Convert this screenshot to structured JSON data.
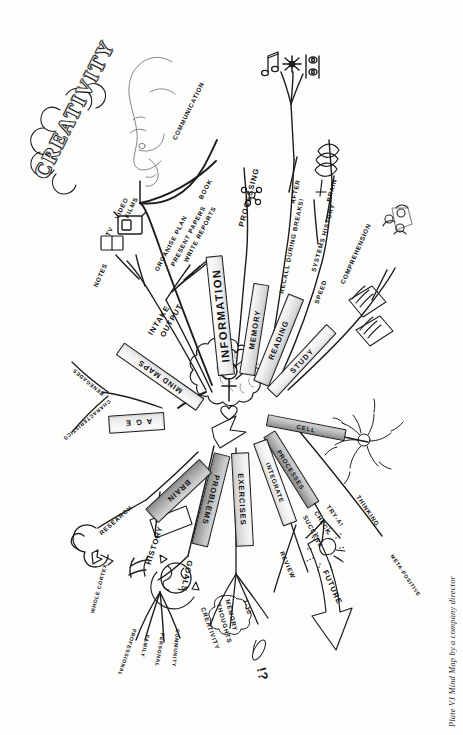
{
  "plate": {
    "caption_prefix": "Plate VJ",
    "caption_rest": " Mind Map by a company director",
    "caption_full": "Plate VJ Mind Map by a company director"
  },
  "center": {
    "label": "brain-centre",
    "icon": "brain-with-key-and-hearts"
  },
  "branches": [
    {
      "id": "creativity",
      "label": "CREATIVITY",
      "style": "ornate-script",
      "children": [
        {
          "label": "COMMUNICATION",
          "children": []
        }
      ],
      "icons": [
        "speaking-head-icon"
      ]
    },
    {
      "id": "mind-maps",
      "label": "MIND MAPS",
      "children": [
        {
          "label": "INTAKE",
          "children": [
            {
              "label": "NOTES"
            },
            {
              "label": "TV"
            },
            {
              "label": "VIDEO"
            },
            {
              "label": "FILMS"
            }
          ],
          "icons": [
            "notes-icon",
            "television-icon"
          ]
        },
        {
          "label": "OUTPUT",
          "children": [
            {
              "label": "ORGANISE PLAN"
            },
            {
              "label": "PRESENT PAPERS"
            },
            {
              "label": "WRITE REPORTS"
            },
            {
              "label": "BOOK"
            }
          ]
        }
      ]
    },
    {
      "id": "information",
      "label": "INFORMATION",
      "children": [
        {
          "label": "PROCESSING"
        }
      ]
    },
    {
      "id": "memory",
      "label": "MEMORY",
      "children": [
        {
          "label": "RECALL DURING BREAKS!"
        },
        {
          "label": "AFTER"
        }
      ],
      "icons": [
        "music-note-icon",
        "sparkle-icon",
        "eyes-icon"
      ]
    },
    {
      "id": "reading",
      "label": "READING",
      "children": [
        {
          "label": "SYSTEMS HISTORY"
        },
        {
          "label": "BRAIN"
        },
        {
          "label": "SPEED"
        },
        {
          "label": "COMPREHENSION"
        }
      ],
      "icons": [
        "eye-lashes-icon"
      ]
    },
    {
      "id": "study",
      "label": "STUDY",
      "children": [],
      "icons": [
        "papers-icon",
        "group-of-people-icon"
      ]
    },
    {
      "id": "cell",
      "label": "CELL",
      "children": [
        {
          "label": "THINKING",
          "children": [
            {
              "label": "META-POSITIVE"
            }
          ]
        }
      ],
      "icons": [
        "neuron-icon"
      ]
    },
    {
      "id": "processes",
      "label": "PROCESSES",
      "children": [
        {
          "label": "SUCCESS"
        },
        {
          "label": "CHECK"
        },
        {
          "label": "TRY-A!"
        }
      ],
      "icons": [
        "lightbulb-icon"
      ]
    },
    {
      "id": "integrate",
      "label": "INTEGRATE",
      "children": [
        {
          "label": "REVIEW"
        },
        {
          "label": "FUTURE"
        }
      ],
      "icons": [
        "future-arrow-icon"
      ]
    },
    {
      "id": "exercises",
      "label": "EXERCISES",
      "children": [
        {
          "label": "MEMORY"
        },
        {
          "label": "1-10"
        },
        {
          "label": "!?"
        },
        {
          "label": "THOUGHTS"
        },
        {
          "label": "CREATIVITY"
        }
      ]
    },
    {
      "id": "problems",
      "label": "PROBLEMS",
      "children": [
        {
          "label": "GOALS",
          "children": [
            {
              "label": "PROFESSIONAL"
            },
            {
              "label": "FAMILY"
            },
            {
              "label": "PERSONAL"
            },
            {
              "label": "COMMUNITY"
            }
          ],
          "icons": [
            "globe-icon"
          ]
        }
      ]
    },
    {
      "id": "brain",
      "label": "BRAIN",
      "children": [
        {
          "label": "RESEARCH",
          "children": [
            {
              "label": "WHOLE CORTEX"
            }
          ],
          "icons": [
            "cortex-icon"
          ]
        },
        {
          "label": "HISTORY"
        }
      ]
    },
    {
      "id": "age",
      "label": "AGE",
      "children": [
        {
          "label": "RENEGADES"
        },
        {
          "label": "CHARACTERISTICS"
        }
      ]
    }
  ]
}
